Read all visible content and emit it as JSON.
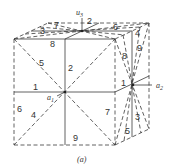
{
  "figure": {
    "caption": "(a)",
    "axes": {
      "u3": {
        "base": "u",
        "sub": "3"
      },
      "a1": {
        "base": "a",
        "sub": "1"
      },
      "a2": {
        "base": "a",
        "sub": "2"
      }
    },
    "labels": {
      "top_2": "2",
      "top_7": "7",
      "top_3": "3",
      "top_6": "6",
      "top_4": "4",
      "top_8": "8",
      "front_5": "5",
      "front_2": "2",
      "front_1": "1",
      "front_6": "6",
      "front_4": "4",
      "front_7": "7",
      "front_9": "9",
      "right_8": "8",
      "right_9": "9",
      "right_1": "1",
      "right_3": "3",
      "right_5": "5"
    }
  }
}
